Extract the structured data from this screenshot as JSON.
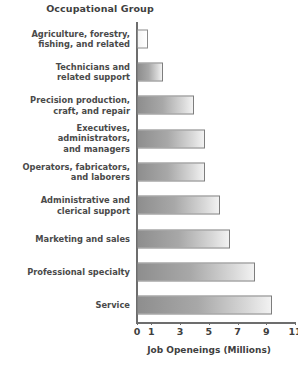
{
  "chart_data": {
    "type": "bar",
    "orientation": "horizontal",
    "title": "Occupational Group",
    "xlabel": "Job Openeings (Millions)",
    "ylabel": "Occupational Group",
    "xlim": [
      0,
      11
    ],
    "xticks": [
      0,
      1,
      3,
      5,
      7,
      9,
      11
    ],
    "xtick_labels": [
      "0",
      "1",
      "3",
      "5",
      "7",
      "9",
      "11"
    ],
    "grid": false,
    "legend": false,
    "categories": [
      "Agriculture, forestry,\nfishing, and related",
      "Technicians and\nrelated support",
      "Precision production,\ncraft, and repair",
      "Executives, administrators,\nand managers",
      "Operators, fabricators,\nand laborers",
      "Administrative and\nclerical support",
      "Marketing and sales",
      "Professional specialty",
      "Service"
    ],
    "values": [
      0.8,
      1.8,
      4.0,
      4.7,
      4.7,
      5.8,
      6.5,
      8.2,
      9.4
    ],
    "bars": [
      {
        "label": "Agriculture, forestry,\nfishing, and related",
        "value": 0.8,
        "style": "pale"
      },
      {
        "label": "Technicians and\nrelated support",
        "value": 1.8,
        "style": "gradient"
      },
      {
        "label": "Precision production,\ncraft, and repair",
        "value": 4.0,
        "style": "gradient"
      },
      {
        "label": "Executives, administrators,\nand managers",
        "value": 4.7,
        "style": "gradient"
      },
      {
        "label": "Operators, fabricators,\nand laborers",
        "value": 4.7,
        "style": "gradient"
      },
      {
        "label": "Administrative and\nclerical support",
        "value": 5.8,
        "style": "gradient"
      },
      {
        "label": "Marketing and sales",
        "value": 6.5,
        "style": "gradient"
      },
      {
        "label": "Professional specialty",
        "value": 8.2,
        "style": "gradient"
      },
      {
        "label": "Service",
        "value": 9.4,
        "style": "gradient"
      }
    ],
    "colors": {
      "bar_fill_dark": "#8e8e8e",
      "bar_fill_light": "#f2f2f2",
      "bar_border": "#7d7d7d",
      "axis": "#6d6d6d",
      "text": "#3f3f3f",
      "background": "#ffffff"
    }
  }
}
